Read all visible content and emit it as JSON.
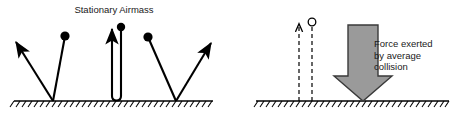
{
  "figure": {
    "type": "physics-diagram",
    "background_color": "#ffffff",
    "ink_color": "#000000",
    "width": 454,
    "height": 126
  },
  "left_panel": {
    "title": "Stationary Airmass",
    "title_x": 114,
    "title_y": 13,
    "ground": {
      "y": 101,
      "x_start": 14,
      "x_end": 213,
      "hatch_count": 34,
      "hatch_length": 7,
      "hatch_angle_deg": 55
    },
    "molecules": [
      {
        "name": "molecule-left-incoming",
        "ball_x": 65,
        "ball_y": 36,
        "ball_r": 4.6,
        "impact_x": 53,
        "impact_y": 101
      },
      {
        "name": "molecule-right-incoming",
        "ball_x": 148,
        "ball_y": 37,
        "ball_r": 4.6,
        "impact_x": 176,
        "impact_y": 101
      }
    ],
    "rebound_arrows": [
      {
        "name": "rebound-arrow-left",
        "from_x": 53,
        "from_y": 101,
        "to_x": 14,
        "to_y": 40
      },
      {
        "name": "rebound-arrow-right",
        "from_x": 176,
        "from_y": 101,
        "to_x": 213,
        "to_y": 41
      }
    ],
    "vertical_bounce": {
      "name": "vertical-bounce-path",
      "ball_x": 121,
      "ball_y": 27,
      "ball_r": 4.2,
      "down_x": 121,
      "up_x": 112,
      "bottom_y": 100,
      "arrow_tip_y": 25
    }
  },
  "right_panel": {
    "caption_lines": [
      "Force exerted",
      "by average",
      "collision"
    ],
    "caption_x": 374,
    "caption_y": 47,
    "caption_line_height": 11.5,
    "ground": {
      "y": 101,
      "x_start": 256,
      "x_end": 449,
      "hatch_count": 33,
      "hatch_length": 7,
      "hatch_angle_deg": 55
    },
    "dashed_path": {
      "name": "dashed-incoming-outgoing-path",
      "incoming_x": 312,
      "outgoing_x": 299,
      "top_y": 22,
      "bottom_y": 101,
      "dash_pattern": "4,3",
      "circle_x": 312,
      "circle_y": 22,
      "circle_r": 3.8,
      "circle_filled": false,
      "arrow_tip_x": 299,
      "arrow_tip_y": 20
    },
    "force_arrow": {
      "name": "average-force-arrow",
      "fill_color": "#9a9a9a",
      "stroke_color": "#3a3a3a",
      "shaft_left_x": 348,
      "shaft_right_x": 378,
      "top_y": 25,
      "head_top_y": 76,
      "head_left_x": 334,
      "head_right_x": 392,
      "tip_x": 363,
      "tip_y": 101,
      "direction": "down"
    }
  }
}
